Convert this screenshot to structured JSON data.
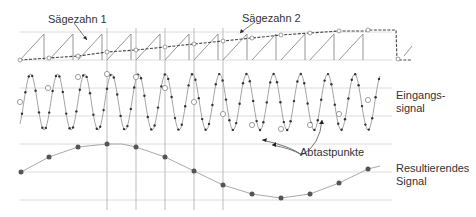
{
  "labels": {
    "sawtooth1": "Sägezahn 1",
    "sawtooth2": "Sägezahn 2",
    "input_signal_line1": "Eingangs-",
    "input_signal_line2": "signal",
    "sample_points": "Abtastpunkte",
    "result_signal_line1": "Resultierendes",
    "result_signal_line2": "Signal"
  },
  "colors": {
    "grid": "#d8d8d8",
    "vertical": "#b8b8b8",
    "curve": "#9a9a9a",
    "dot": "#333333",
    "result_dot": "#555555",
    "text": "#333333"
  }
}
